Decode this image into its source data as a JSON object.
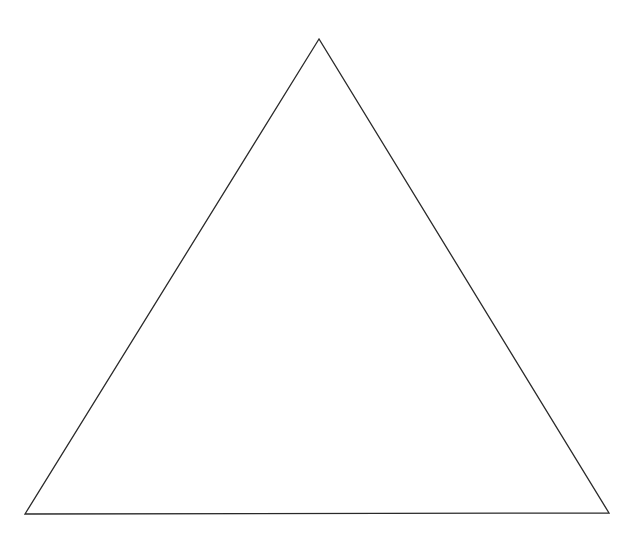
{
  "canvas": {
    "width": 641,
    "height": 541,
    "background": "#ffffff"
  },
  "shapes": [
    {
      "type": "triangle",
      "name": "equilateral-triangle-outline",
      "points": [
        [
          319,
          39
        ],
        [
          25,
          514
        ],
        [
          609,
          513
        ]
      ],
      "stroke": "#2a2a2a",
      "stroke_width": 1.3,
      "fill": "none"
    }
  ]
}
